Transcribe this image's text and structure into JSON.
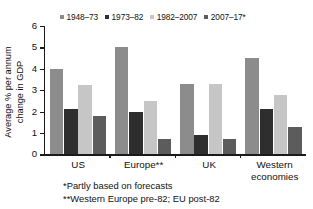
{
  "chart_data": {
    "type": "bar",
    "title": "",
    "subtitle": "",
    "xlabel": "",
    "ylabel": "Average % per annum change in GDP",
    "ylabel_line1": "Average % per annum",
    "ylabel_line2": "change in GDP",
    "ylim": [
      0,
      6
    ],
    "yticks": [
      0,
      1,
      2,
      3,
      4,
      5,
      6
    ],
    "ytick_labels": [
      "0",
      "1",
      "2",
      "3",
      "4",
      "5",
      "6"
    ],
    "grid": false,
    "legend_position": "top",
    "categories": [
      "US",
      "Europe**",
      "UK",
      "Western economies"
    ],
    "category_labels": [
      {
        "line1": "US",
        "line2": ""
      },
      {
        "line1": "Europe**",
        "line2": ""
      },
      {
        "line1": "UK",
        "line2": ""
      },
      {
        "line1": "Western",
        "line2": "economies"
      }
    ],
    "series": [
      {
        "name": "1948–73",
        "color": "#8c8c8c",
        "values": [
          4.0,
          5.0,
          3.3,
          4.5
        ]
      },
      {
        "name": "1973–82",
        "color": "#2e2e2e",
        "values": [
          2.1,
          2.0,
          0.9,
          2.1
        ]
      },
      {
        "name": "1982–2007",
        "color": "#c6c6c6",
        "values": [
          3.25,
          2.5,
          3.3,
          2.8
        ]
      },
      {
        "name": "2007–17*",
        "color": "#5c5c5c",
        "values": [
          1.8,
          0.7,
          0.7,
          1.3
        ]
      }
    ],
    "annotations": [
      "*Partly based on forecasts",
      "**Western Europe pre-82; EU post-82"
    ]
  },
  "footnotes": {
    "line1": "*Partly based on forecasts",
    "line2": "**Western Europe pre-82; EU post-82"
  }
}
